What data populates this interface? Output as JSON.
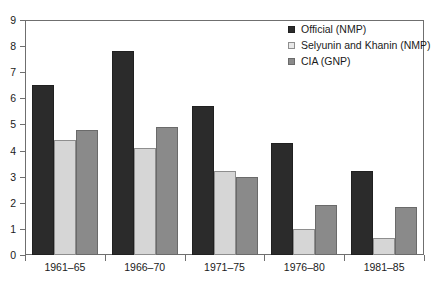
{
  "chart_data": {
    "type": "bar",
    "title": "",
    "subtitle": "",
    "xlabel": "",
    "ylabel": "",
    "ylim": [
      0,
      9
    ],
    "yticks": [
      0,
      1,
      2,
      3,
      4,
      5,
      6,
      7,
      8,
      9
    ],
    "ytick_labels": [
      "0",
      "1",
      "2",
      "3",
      "4",
      "5",
      "6",
      "7",
      "8",
      "9"
    ],
    "grid": false,
    "legend_position": "top-right",
    "categories": [
      "1961–65",
      "1966–70",
      "1971–75",
      "1976–80",
      "1981–85"
    ],
    "series": [
      {
        "name": "Official (NMP)",
        "color": "#2b2b2b",
        "values": [
          6.5,
          7.8,
          5.7,
          4.3,
          3.2
        ]
      },
      {
        "name": "Selyunin and Khanin (NMP)",
        "color": "#d6d6d6",
        "values": [
          4.4,
          4.1,
          3.2,
          1.0,
          0.65
        ]
      },
      {
        "name": "CIA (GNP)",
        "color": "#8a8a8a",
        "values": [
          4.8,
          4.9,
          3.0,
          1.9,
          1.85
        ]
      }
    ]
  },
  "axis": {
    "frame_color": "#6f6f6f"
  }
}
